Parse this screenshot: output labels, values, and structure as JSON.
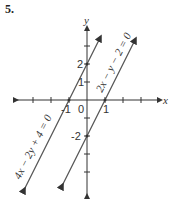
{
  "problem_number": "5.",
  "axes": {
    "x_label": "x",
    "y_label": "y",
    "origin_label": "0",
    "x_tick_labels": [
      {
        "value": -1,
        "text": "-1"
      },
      {
        "value": 1,
        "text": "1"
      }
    ],
    "y_tick_labels": [
      {
        "value": 2,
        "text": "2"
      },
      {
        "value": 1,
        "text": "1"
      },
      {
        "value": -2,
        "text": "-2"
      }
    ]
  },
  "lines": [
    {
      "equation": "2x − y − 2 = 0",
      "x_intercept": 1,
      "y_intercept": -2,
      "slope": 2
    },
    {
      "equation": "4x − 2y + 4 = 0",
      "x_intercept": -1,
      "y_intercept": 2,
      "slope": 2
    }
  ],
  "colors": {
    "line": "#555555",
    "axis": "#333333",
    "text": "#333333"
  }
}
